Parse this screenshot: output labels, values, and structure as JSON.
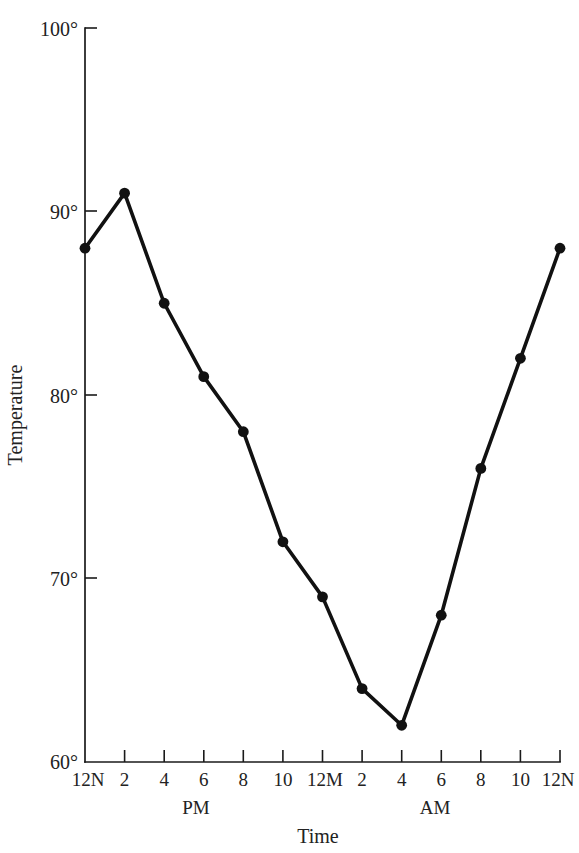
{
  "chart_data": {
    "type": "line",
    "title": "",
    "xlabel": "Time",
    "ylabel": "Temperature",
    "ylim": [
      60,
      100
    ],
    "yticks": [
      60,
      70,
      80,
      90,
      100
    ],
    "ytick_labels": [
      "60°",
      "70°",
      "80°",
      "90°",
      "100°"
    ],
    "grid": false,
    "legend": "none",
    "x_tick_labels": [
      "12N",
      "2",
      "4",
      "6",
      "8",
      "10",
      "12M",
      "2",
      "4",
      "6",
      "8",
      "10",
      "12N"
    ],
    "x_period_labels": [
      {
        "text": "PM",
        "center_tick_index": 3
      },
      {
        "text": "AM",
        "center_tick_index": 9
      }
    ],
    "categories": [
      "12N",
      "2PM",
      "4PM",
      "6PM",
      "8PM",
      "10PM",
      "12M",
      "2AM",
      "4AM",
      "6AM",
      "8AM",
      "10AM",
      "12N"
    ],
    "values": [
      88,
      91,
      85,
      81,
      78,
      72,
      69,
      64,
      62,
      68,
      76,
      82,
      88
    ],
    "marker": "filled-circle",
    "line_color": "#111111",
    "marker_color": "#111111",
    "background_color": "#ffffff"
  },
  "axis": {
    "y_axis_name": "Temperature",
    "x_axis_name": "Time"
  }
}
